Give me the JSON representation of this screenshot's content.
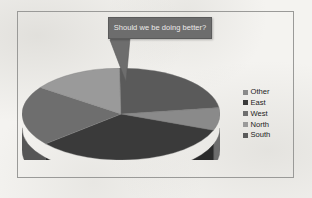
{
  "figure": {
    "border_color": "#9a9a98",
    "background": "#f4f3f0"
  },
  "callout": {
    "text": "Should we be doing better?",
    "fill": "#6d6d6d",
    "border": "#5b5b5b",
    "text_color": "#eceaea",
    "tail_target": "pie-center"
  },
  "legend": {
    "position": "right",
    "items": [
      {
        "label": "Other",
        "color": "#8a8a8a"
      },
      {
        "label": "East",
        "color": "#3a3a3a"
      },
      {
        "label": "West",
        "color": "#6e6e6e"
      },
      {
        "label": "North",
        "color": "#9a9a9a"
      },
      {
        "label": "South",
        "color": "#5a5a5a"
      }
    ]
  },
  "chart_data": {
    "type": "pie",
    "title": "",
    "is_3d": true,
    "categories": [
      "Other",
      "East",
      "West",
      "North",
      "South"
    ],
    "values": [
      8,
      33,
      21,
      15,
      23
    ],
    "colors": [
      "#8a8a8a",
      "#3a3a3a",
      "#6e6e6e",
      "#9a9a9a",
      "#5a5a5a"
    ],
    "side_colors": [
      "#6d6d6d",
      "#2a2a2a",
      "#565656",
      "#787878",
      "#464646"
    ],
    "start_angle": -8,
    "legend_entries": [
      "Other",
      "East",
      "West",
      "North",
      "South"
    ],
    "annotations": [
      "Should we be doing better?"
    ],
    "xlabel": "",
    "ylabel": "",
    "grid": false,
    "data_labels_shown": false
  }
}
